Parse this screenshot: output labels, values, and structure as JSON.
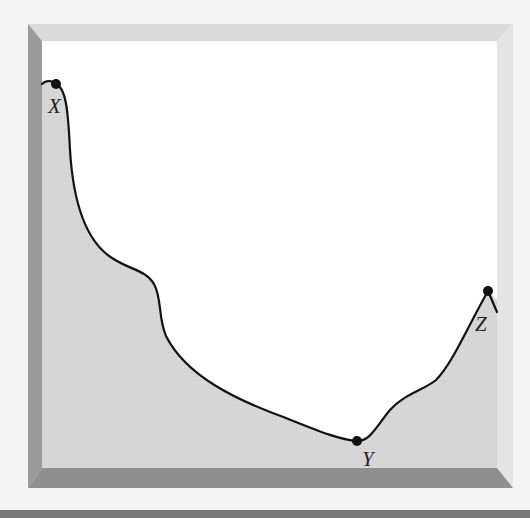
{
  "diagram": {
    "type": "cross-section-profile",
    "colors": {
      "page_background": "#f4f4f4",
      "frame_top": "#dadada",
      "frame_right": "#e2e2e2",
      "frame_left": "#9a9a9a",
      "frame_bottom": "#8f8f8f",
      "interior_sky": "#ffffff",
      "ground_fill": "#d6d6d6",
      "profile_line": "#111111",
      "point_fill": "#111111",
      "bottom_bar": "#7a7a7a"
    },
    "points": [
      {
        "id": "X",
        "label": "X",
        "x": 56,
        "y": 84,
        "label_x": 48,
        "label_y": 113
      },
      {
        "id": "Y",
        "label": "Y",
        "x": 357,
        "y": 441,
        "label_x": 362,
        "label_y": 466
      },
      {
        "id": "Z",
        "label": "Z",
        "x": 488,
        "y": 291,
        "label_x": 475,
        "label_y": 331
      }
    ]
  }
}
